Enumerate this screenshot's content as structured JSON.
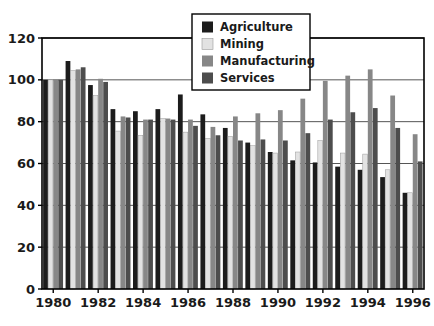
{
  "chart_data": {
    "type": "bar",
    "title": "",
    "subtitle": "",
    "xlabel": "",
    "ylabel": "",
    "ylim": [
      0,
      120
    ],
    "yticks": [
      0,
      20,
      40,
      60,
      80,
      100,
      120
    ],
    "ytick_labels": [
      "0",
      "20",
      "40",
      "60",
      "80",
      "100",
      "120"
    ],
    "grid": true,
    "grid_axis": "y",
    "legend_position": "top-center",
    "categories": [
      1980,
      1981,
      1982,
      1983,
      1984,
      1985,
      1986,
      1987,
      1988,
      1989,
      1990,
      1991,
      1992,
      1993,
      1994,
      1995,
      1996
    ],
    "xtick_labels": [
      "1980",
      "1982",
      "1984",
      "1986",
      "1988",
      "1990",
      "1992",
      "1994",
      "1996"
    ],
    "xtick_categories": [
      1980,
      1982,
      1984,
      1986,
      1988,
      1990,
      1992,
      1994,
      1996
    ],
    "series": [
      {
        "name": "Agriculture",
        "color": "#1c1c1c",
        "values": [
          100,
          109,
          97.5,
          86,
          85,
          86,
          93,
          83.5,
          77,
          70,
          65.5,
          61.5,
          60.5,
          58.5,
          57,
          53.5,
          46
        ]
      },
      {
        "name": "Mining",
        "color": "#e2e2e2",
        "values": [
          100,
          104.5,
          92.5,
          75.5,
          73.5,
          81.5,
          75,
          72,
          73,
          68.5,
          65,
          65.5,
          71,
          65,
          64.5,
          57,
          46
        ]
      },
      {
        "name": "Manufacturing",
        "color": "#878787",
        "values": [
          100,
          105,
          100.5,
          82.5,
          81,
          81.5,
          81,
          77.5,
          82.5,
          84,
          85.5,
          91,
          99.5,
          102,
          105,
          92.5,
          74
        ]
      },
      {
        "name": "Services",
        "color": "#4d4d4d",
        "values": [
          100,
          106,
          99,
          82,
          81,
          81,
          78,
          73.5,
          71,
          71.5,
          71,
          74.5,
          81,
          84.5,
          86.5,
          77,
          61
        ]
      }
    ]
  },
  "legend": {
    "items": [
      {
        "label": "Agriculture",
        "swatch": "#1c1c1c"
      },
      {
        "label": "Mining",
        "swatch": "#e2e2e2"
      },
      {
        "label": "Manufacturing",
        "swatch": "#878787"
      },
      {
        "label": "Services",
        "swatch": "#4d4d4d"
      }
    ]
  },
  "axis_colors": {
    "axis_line": "#000000",
    "grid_line": "#555555",
    "plot_background": "#ffffff"
  }
}
